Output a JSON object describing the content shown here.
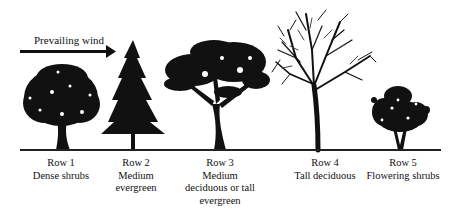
{
  "diagram": {
    "wind": {
      "label": "Prevailing wind",
      "direction": "left-to-right"
    },
    "rows": [
      {
        "id": 1,
        "title": "Row 1",
        "lines": [
          "Dense shrubs"
        ],
        "plant": "dense-shrub"
      },
      {
        "id": 2,
        "title": "Row 2",
        "lines": [
          "Medium",
          "evergreen"
        ],
        "plant": "evergreen-conifer"
      },
      {
        "id": 3,
        "title": "Row 3",
        "lines": [
          "Medium",
          "deciduous or tall",
          "evergreen"
        ],
        "plant": "spreading-deciduous-tree"
      },
      {
        "id": 4,
        "title": "Row 4",
        "lines": [
          "Tall deciduous"
        ],
        "plant": "tall-deciduous-tree"
      },
      {
        "id": 5,
        "title": "Row 5",
        "lines": [
          "Flowering shrubs"
        ],
        "plant": "flowering-shrub"
      }
    ],
    "colors": {
      "ink": "#111111",
      "background": "#ffffff"
    }
  }
}
